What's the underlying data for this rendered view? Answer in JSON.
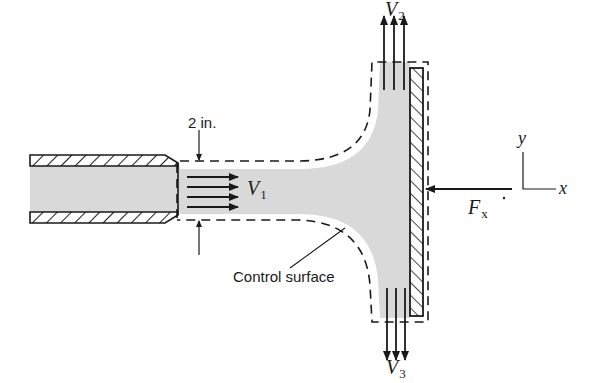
{
  "figure": {
    "type": "fluid-mechanics control volume diagram"
  },
  "labels": {
    "diameter": "2 in.",
    "v1": "V",
    "v1_sub": "1",
    "v2": "V",
    "v2_sub": "2",
    "v3": "V",
    "v3_sub": "3",
    "fx": "F",
    "fx_sub": "x",
    "control_surface": "Control surface",
    "axis_y": "y",
    "axis_x": "x"
  },
  "colors": {
    "fluid": "#d9d9d9",
    "ink": "#1a1a1a",
    "background": "#ffffff"
  }
}
